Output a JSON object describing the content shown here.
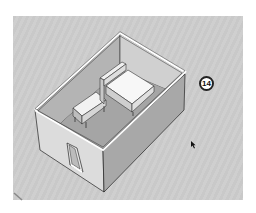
{
  "viewport": {
    "background": "#cbcbcb",
    "description": "3D model view of a rectangular room with bed and bench"
  },
  "model": {
    "objects": [
      "room-walls",
      "bed",
      "headboard",
      "bench",
      "door"
    ]
  },
  "step_badge": {
    "label": "14"
  },
  "cursor": {
    "icon": "mouse-pointer-icon"
  }
}
